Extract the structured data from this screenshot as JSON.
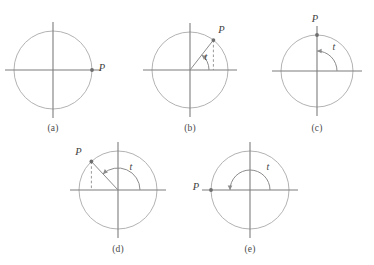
{
  "figure": {
    "type": "math-diagram-set",
    "background_color": "#ffffff",
    "line_color": "#8c8c8c",
    "circle_color": "#a9a9a9",
    "axis_color": "#7d7d7d",
    "label_color": "#3f3f3f",
    "point_color": "#6e6e6e",
    "footnote": "",
    "point_label": "P",
    "angle_label": "t",
    "panels": [
      {
        "id": "a",
        "caption": "(a)",
        "center": {
          "x": 53,
          "y": 70
        },
        "radius": 39,
        "angle_deg": 0,
        "has_radius_line": false,
        "has_dashed_drop": false,
        "has_arc": false,
        "arc_radius": 0,
        "point_label_dx": 10,
        "point_label_dy": 1,
        "angle_label_pos": {
          "x": 0,
          "y": 0
        },
        "caption_pos": {
          "x": 53,
          "y": 124
        }
      },
      {
        "id": "b",
        "caption": "(b)",
        "center": {
          "x": 190,
          "y": 70
        },
        "radius": 38,
        "angle_deg": 52,
        "has_radius_line": true,
        "has_dashed_drop": true,
        "has_arc": true,
        "arc_radius": 19,
        "point_label_dx": 8,
        "point_label_dy": -7,
        "angle_label_pos": {
          "x": 206,
          "y": 60
        },
        "caption_pos": {
          "x": 190,
          "y": 124
        }
      },
      {
        "id": "c",
        "caption": "(c)",
        "center": {
          "x": 317,
          "y": 71
        },
        "radius": 36,
        "angle_deg": 90,
        "has_radius_line": false,
        "has_dashed_drop": false,
        "has_arc": true,
        "arc_radius": 20,
        "point_label_dx": -2,
        "point_label_dy": -13,
        "angle_label_pos": {
          "x": 334,
          "y": 50
        },
        "caption_pos": {
          "x": 317,
          "y": 124
        }
      },
      {
        "id": "d",
        "caption": "(d)",
        "center": {
          "x": 118,
          "y": 190
        },
        "radius": 39,
        "angle_deg": 133,
        "has_radius_line": true,
        "has_dashed_drop": true,
        "has_arc": true,
        "arc_radius": 22,
        "point_label_dx": -13,
        "point_label_dy": -6,
        "angle_label_pos": {
          "x": 131,
          "y": 170
        },
        "caption_pos": {
          "x": 118,
          "y": 245
        }
      },
      {
        "id": "e",
        "caption": "(e)",
        "center": {
          "x": 250,
          "y": 190
        },
        "radius": 39,
        "angle_deg": 180,
        "has_radius_line": false,
        "has_dashed_drop": false,
        "has_arc": true,
        "arc_radius": 20,
        "point_label_dx": -15,
        "point_label_dy": 0,
        "angle_label_pos": {
          "x": 268,
          "y": 170
        },
        "caption_pos": {
          "x": 250,
          "y": 245
        }
      }
    ]
  }
}
